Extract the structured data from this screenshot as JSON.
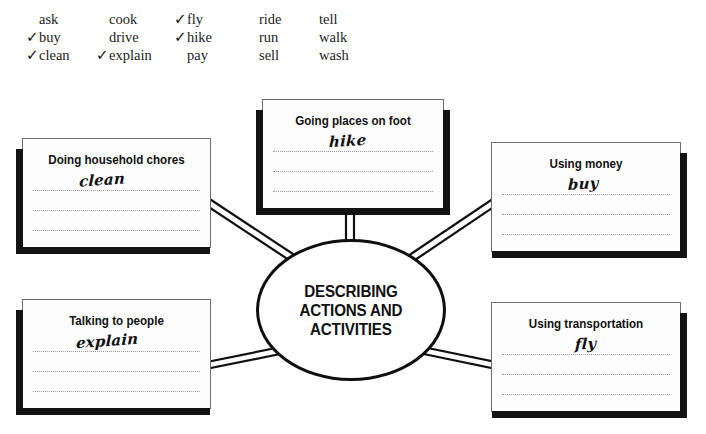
{
  "worksheet": {
    "center_label": "DESCRIBING ACTIONS AND ACTIVITIES",
    "center_lines": [
      "DESCRIBING",
      "ACTIONS AND",
      "ACTIVITIES"
    ],
    "check_glyph": "✓"
  },
  "word_bank": {
    "columns": [
      {
        "words": [
          {
            "text": "ask",
            "checked": false
          },
          {
            "text": "buy",
            "checked": true
          },
          {
            "text": "clean",
            "checked": true
          }
        ]
      },
      {
        "words": [
          {
            "text": "cook",
            "checked": false
          },
          {
            "text": "drive",
            "checked": false
          },
          {
            "text": "explain",
            "checked": true
          }
        ]
      },
      {
        "words": [
          {
            "text": "fly",
            "checked": true
          },
          {
            "text": "hike",
            "checked": true
          },
          {
            "text": "pay",
            "checked": false
          }
        ]
      },
      {
        "words": [
          {
            "text": "ride",
            "checked": false
          },
          {
            "text": "run",
            "checked": false
          },
          {
            "text": "sell",
            "checked": false
          }
        ]
      },
      {
        "words": [
          {
            "text": "tell",
            "checked": false
          },
          {
            "text": "walk",
            "checked": false
          },
          {
            "text": "wash",
            "checked": false
          }
        ]
      }
    ]
  },
  "cards": {
    "top": {
      "title": "Going places on foot",
      "answer": "hike",
      "line_count": 3
    },
    "top_left": {
      "title": "Doing household chores",
      "answer": "clean",
      "line_count": 3
    },
    "top_right": {
      "title": "Using money",
      "answer": "buy",
      "line_count": 3
    },
    "bottom_left": {
      "title": "Talking to people",
      "answer": "explain",
      "line_count": 3
    },
    "bottom_right": {
      "title": "Using transportation",
      "answer": "fly",
      "line_count": 3
    }
  },
  "colors": {
    "ink": "#111111",
    "shadow": "#131313",
    "card_border": "#6e6e6e",
    "dotted_line": "#9a9a9a",
    "paper": "#ffffff"
  }
}
